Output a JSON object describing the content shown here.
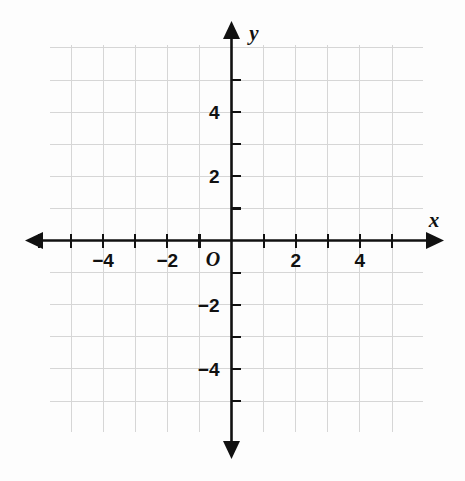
{
  "chart_data": {
    "type": "scatter",
    "title": "",
    "subtitle": "",
    "xlabel": "x",
    "ylabel": "y",
    "origin_label": "O",
    "xlim": [
      -6,
      6
    ],
    "ylim": [
      -6,
      6
    ],
    "grid": true,
    "grid_step": 1,
    "x_ticks": [
      -6,
      -5,
      -4,
      -3,
      -2,
      -1,
      1,
      2,
      3,
      4,
      5
    ],
    "y_ticks": [
      5,
      4,
      3,
      2,
      1,
      -1,
      -2,
      -3,
      -4,
      -5
    ],
    "x_tick_labels": [
      {
        "value": -4,
        "text": "−4"
      },
      {
        "value": -2,
        "text": "−2"
      },
      {
        "value": 2,
        "text": "2"
      },
      {
        "value": 4,
        "text": "4"
      }
    ],
    "y_tick_labels": [
      {
        "value": 4,
        "text": "4"
      },
      {
        "value": 2,
        "text": "2"
      },
      {
        "value": -2,
        "text": "−2"
      },
      {
        "value": -4,
        "text": "−4"
      }
    ],
    "series": [],
    "values": [],
    "categories": [],
    "annotations": [],
    "legend": null
  },
  "figure": {
    "axis_arrow_x_positive": "arrow-right",
    "axis_arrow_x_negative": "arrow-left",
    "axis_arrow_y_positive": "arrow-up",
    "axis_arrow_y_negative": "arrow-down"
  },
  "colors": {
    "background": "#fdfdfd",
    "grid_line": "#d6d6d6",
    "axis_line": "#111111",
    "tick_text": "#111111"
  }
}
